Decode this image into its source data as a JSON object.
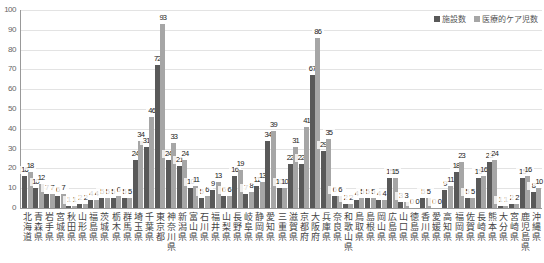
{
  "chart_data": {
    "type": "bar",
    "title": "",
    "xlabel": "",
    "ylabel": "",
    "ylim": [
      0,
      100
    ],
    "yticks": [
      0,
      10,
      20,
      30,
      40,
      50,
      60,
      70,
      80,
      90,
      100
    ],
    "grid": true,
    "legend_position": "top-right",
    "categories": [
      "北海道",
      "青森県",
      "岩手県",
      "宮城県",
      "秋田県",
      "山形県",
      "福島県",
      "茨城県",
      "栃木県",
      "群馬県",
      "埼玉県",
      "千葉県",
      "東京都",
      "神奈川県",
      "新潟県",
      "富山県",
      "石川県",
      "福井県",
      "山梨県",
      "長野県",
      "岐阜県",
      "静岡県",
      "愛知県",
      "三重県",
      "滋賀県",
      "京都府",
      "大阪府",
      "兵庫県",
      "奈良県",
      "和歌山県",
      "鳥取県",
      "島根県",
      "岡山県",
      "広島県",
      "山口県",
      "徳島県",
      "香川県",
      "愛媛県",
      "高知県",
      "福岡県",
      "佐賀県",
      "長崎県",
      "熊本県",
      "大分県",
      "宮崎県",
      "鹿児島県",
      "沖縄県"
    ],
    "series": [
      {
        "name": "施設数",
        "color": "#595959",
        "values": [
          16,
          10,
          7,
          6,
          1,
          2,
          4,
          5,
          5,
          5,
          24,
          31,
          72,
          24,
          21,
          10,
          5,
          9,
          6,
          16,
          7,
          11,
          34,
          10,
          22,
          22,
          67,
          29,
          6,
          2,
          4,
          5,
          4,
          15,
          3,
          0,
          5,
          0,
          9,
          18,
          5,
          15,
          23,
          1,
          2,
          15,
          8
        ]
      },
      {
        "name": "医療的ケア児数",
        "color": "#a6a6a6",
        "values": [
          18,
          12,
          7,
          7,
          1,
          2,
          4,
          5,
          6,
          5,
          34,
          46,
          93,
          33,
          24,
          11,
          6,
          13,
          6,
          19,
          8,
          13,
          39,
          10,
          31,
          41,
          86,
          35,
          6,
          2,
          5,
          5,
          4,
          15,
          3,
          0,
          5,
          0,
          11,
          23,
          5,
          16,
          24,
          1,
          2,
          16,
          10
        ]
      }
    ]
  },
  "legend": {
    "items": [
      {
        "label": "施設数",
        "color": "#595959"
      },
      {
        "label": "医療的ケア児数",
        "color": "#a6a6a6"
      }
    ]
  }
}
